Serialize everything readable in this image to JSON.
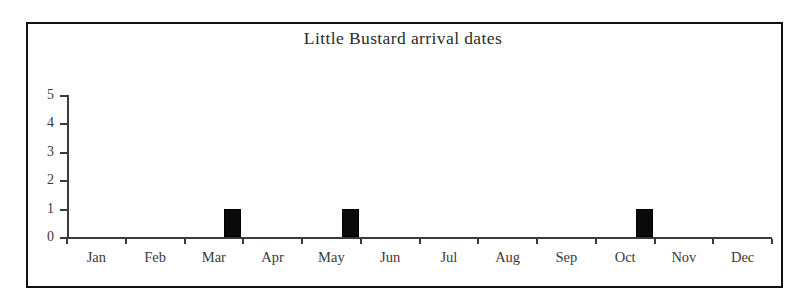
{
  "chart_data": {
    "type": "bar",
    "title": "Little Bustard arrival dates",
    "xlabel": "",
    "ylabel": "",
    "categories": [
      "Jan",
      "Feb",
      "Mar",
      "Apr",
      "May",
      "Jun",
      "Jul",
      "Aug",
      "Sep",
      "Oct",
      "Nov",
      "Dec"
    ],
    "values": [
      0,
      0,
      1,
      0,
      1,
      0,
      0,
      0,
      0,
      1,
      0,
      0
    ],
    "ylim": [
      0,
      5
    ],
    "yticks": [
      0,
      1,
      2,
      3,
      4,
      5
    ],
    "ytick_labels": [
      "0",
      "1",
      "2",
      "3",
      "4",
      "5"
    ],
    "grid": false,
    "legend": null,
    "bar_color": "#0a0a0a",
    "axis_color": "#3a3a3a",
    "background_color": "#ffffff",
    "frame_color": "#111111"
  }
}
